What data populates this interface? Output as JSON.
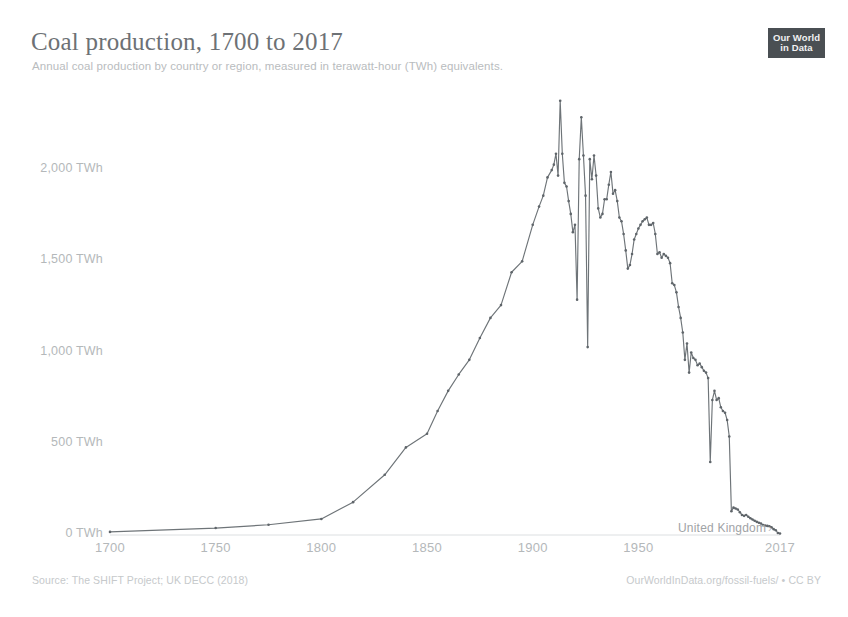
{
  "header": {
    "title": "Coal production, 1700 to 2017",
    "subtitle": "Annual coal production by country or region, measured in terawatt-hour (TWh) equivalents.",
    "logo_line1": "Our World",
    "logo_line2": "in Data"
  },
  "footer": {
    "source": "Source: The SHIFT Project; UK DECC (2018)",
    "note": "OurWorldInData.org/fossil-fuels/ • CC BY"
  },
  "series_label": {
    "text": "United Kingdom",
    "arrow": "›"
  },
  "colors": {
    "line": "#6e7478",
    "marker": "#5f656a",
    "title": "#6d7175",
    "subtitle": "#b9bcbe",
    "axis_text": "#b4b8ba",
    "footer_text": "#c6c9cb",
    "logo_bg": "#4a4f53",
    "background": "#ffffff"
  },
  "chart_data": {
    "type": "line",
    "title": "Coal production, 1700 to 2017",
    "subtitle": "Annual coal production by country or region, measured in terawatt-hour (TWh) equivalents.",
    "xlabel": "",
    "ylabel": "",
    "xlim": [
      1700,
      2017
    ],
    "ylim": [
      0,
      2450
    ],
    "grid": false,
    "legend": "inline-end-label",
    "x_ticks": [
      1700,
      1750,
      1800,
      1850,
      1900,
      1950,
      2017
    ],
    "x_tick_labels": [
      "1700",
      "1750",
      "1800",
      "1850",
      "1900",
      "1950",
      "2017"
    ],
    "y_ticks": [
      0,
      500,
      1000,
      1500,
      2000
    ],
    "y_tick_labels": [
      "0 TWh",
      "500 TWh",
      "1,000 TWh",
      "1,500 TWh",
      "2,000 TWh"
    ],
    "series": [
      {
        "name": "United Kingdom",
        "unit": "TWh",
        "color": "#6e7478",
        "points": [
          [
            1700,
            17
          ],
          [
            1750,
            38
          ],
          [
            1775,
            56
          ],
          [
            1800,
            88
          ],
          [
            1815,
            180
          ],
          [
            1830,
            330
          ],
          [
            1840,
            480
          ],
          [
            1850,
            555
          ],
          [
            1855,
            680
          ],
          [
            1860,
            790
          ],
          [
            1865,
            880
          ],
          [
            1870,
            960
          ],
          [
            1875,
            1080
          ],
          [
            1880,
            1190
          ],
          [
            1885,
            1260
          ],
          [
            1890,
            1440
          ],
          [
            1895,
            1500
          ],
          [
            1900,
            1700
          ],
          [
            1903,
            1800
          ],
          [
            1905,
            1860
          ],
          [
            1907,
            1960
          ],
          [
            1909,
            2000
          ],
          [
            1910,
            2030
          ],
          [
            1911,
            2090
          ],
          [
            1912,
            1970
          ],
          [
            1913,
            2380
          ],
          [
            1914,
            2090
          ],
          [
            1915,
            1930
          ],
          [
            1916,
            1910
          ],
          [
            1917,
            1830
          ],
          [
            1918,
            1760
          ],
          [
            1919,
            1660
          ],
          [
            1920,
            1700
          ],
          [
            1921,
            1290
          ],
          [
            1922,
            2060
          ],
          [
            1923,
            2290
          ],
          [
            1924,
            2080
          ],
          [
            1925,
            1860
          ],
          [
            1926,
            1030
          ],
          [
            1927,
            2060
          ],
          [
            1928,
            1950
          ],
          [
            1929,
            2080
          ],
          [
            1930,
            1970
          ],
          [
            1931,
            1790
          ],
          [
            1932,
            1740
          ],
          [
            1933,
            1760
          ],
          [
            1934,
            1840
          ],
          [
            1935,
            1840
          ],
          [
            1936,
            1920
          ],
          [
            1937,
            1990
          ],
          [
            1938,
            1870
          ],
          [
            1939,
            1890
          ],
          [
            1940,
            1830
          ],
          [
            1941,
            1740
          ],
          [
            1942,
            1720
          ],
          [
            1943,
            1650
          ],
          [
            1944,
            1560
          ],
          [
            1945,
            1460
          ],
          [
            1946,
            1480
          ],
          [
            1947,
            1540
          ],
          [
            1948,
            1620
          ],
          [
            1949,
            1650
          ],
          [
            1950,
            1680
          ],
          [
            1951,
            1700
          ],
          [
            1952,
            1720
          ],
          [
            1953,
            1730
          ],
          [
            1954,
            1740
          ],
          [
            1955,
            1700
          ],
          [
            1956,
            1700
          ],
          [
            1957,
            1710
          ],
          [
            1958,
            1650
          ],
          [
            1959,
            1540
          ],
          [
            1960,
            1550
          ],
          [
            1961,
            1520
          ],
          [
            1962,
            1540
          ],
          [
            1963,
            1530
          ],
          [
            1964,
            1520
          ],
          [
            1965,
            1490
          ],
          [
            1966,
            1380
          ],
          [
            1967,
            1370
          ],
          [
            1968,
            1330
          ],
          [
            1969,
            1250
          ],
          [
            1970,
            1190
          ],
          [
            1971,
            1110
          ],
          [
            1972,
            960
          ],
          [
            1973,
            1050
          ],
          [
            1974,
            890
          ],
          [
            1975,
            1000
          ],
          [
            1976,
            970
          ],
          [
            1977,
            960
          ],
          [
            1978,
            930
          ],
          [
            1979,
            940
          ],
          [
            1980,
            920
          ],
          [
            1981,
            900
          ],
          [
            1982,
            890
          ],
          [
            1983,
            860
          ],
          [
            1984,
            400
          ],
          [
            1985,
            740
          ],
          [
            1986,
            790
          ],
          [
            1987,
            740
          ],
          [
            1988,
            750
          ],
          [
            1989,
            700
          ],
          [
            1990,
            680
          ],
          [
            1991,
            670
          ],
          [
            1992,
            630
          ],
          [
            1993,
            540
          ],
          [
            1994,
            130
          ],
          [
            1995,
            150
          ],
          [
            1996,
            145
          ],
          [
            1997,
            140
          ],
          [
            1998,
            125
          ],
          [
            1999,
            110
          ],
          [
            2000,
            105
          ],
          [
            2001,
            110
          ],
          [
            2002,
            100
          ],
          [
            2003,
            92
          ],
          [
            2004,
            85
          ],
          [
            2005,
            78
          ],
          [
            2006,
            72
          ],
          [
            2007,
            67
          ],
          [
            2008,
            63
          ],
          [
            2009,
            54
          ],
          [
            2010,
            52
          ],
          [
            2011,
            50
          ],
          [
            2012,
            48
          ],
          [
            2013,
            42
          ],
          [
            2014,
            32
          ],
          [
            2015,
            26
          ],
          [
            2016,
            11
          ],
          [
            2017,
            8
          ]
        ]
      }
    ],
    "annotations": [
      {
        "label": "Peak production",
        "x": 1913,
        "y": 2380
      },
      {
        "label": "1921 coal strike",
        "x": 1921,
        "y": 1290
      },
      {
        "label": "1926 general strike",
        "x": 1926,
        "y": 1030
      },
      {
        "label": "1984 miners' strike",
        "x": 1984,
        "y": 400
      }
    ]
  }
}
